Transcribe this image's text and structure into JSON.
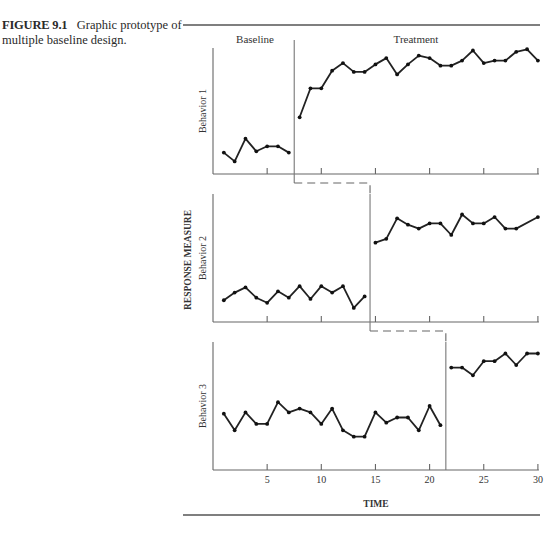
{
  "caption": {
    "figure_label": "FIGURE 9.1",
    "text": "Graphic prototype of multiple baseline design."
  },
  "chart_data": {
    "type": "line",
    "title": "Graphic prototype of multiple baseline design",
    "xlabel": "TIME",
    "ylabel": "RESPONSE MEASURE",
    "xlim": [
      0,
      30
    ],
    "ylim": [
      0,
      100
    ],
    "x_ticks": [
      5,
      10,
      15,
      20,
      25,
      30
    ],
    "x_tick_labels": [
      "5",
      "10",
      "15",
      "20",
      "25",
      "30"
    ],
    "grid": false,
    "legend": null,
    "phase_labels": [
      "Baseline",
      "Treatment"
    ],
    "panels": [
      {
        "name": "Behavior 1",
        "phase_change_after": 7,
        "series": [
          {
            "name": "Baseline",
            "x": [
              1,
              2,
              3,
              4,
              5,
              6,
              7
            ],
            "values": [
              17,
              10,
              28,
              18,
              22,
              22,
              17
            ]
          },
          {
            "name": "Treatment",
            "x": [
              8,
              9,
              10,
              11,
              12,
              13,
              14,
              15,
              16,
              17,
              18,
              19,
              20,
              21,
              22,
              23,
              24,
              25,
              26,
              27,
              28,
              29,
              30
            ],
            "values": [
              45,
              68,
              68,
              82,
              88,
              81,
              81,
              87,
              92,
              79,
              87,
              94,
              92,
              86,
              86,
              90,
              98,
              88,
              90,
              90,
              97,
              99,
              90
            ]
          }
        ]
      },
      {
        "name": "Behavior 2",
        "phase_change_after": 14,
        "series": [
          {
            "name": "Baseline",
            "x": [
              1,
              2,
              3,
              4,
              5,
              6,
              7,
              8,
              9,
              10,
              11,
              12,
              13,
              14
            ],
            "values": [
              17,
              23,
              27,
              19,
              15,
              24,
              19,
              28,
              18,
              28,
              23,
              28,
              11,
              20
            ]
          },
          {
            "name": "Treatment",
            "x": [
              15,
              16,
              17,
              18,
              19,
              20,
              21,
              22,
              23,
              24,
              25,
              26,
              27,
              28,
              30
            ],
            "values": [
              62,
              65,
              81,
              76,
              73,
              77,
              77,
              68,
              84,
              77,
              77,
              82,
              73,
              73,
              82
            ]
          }
        ]
      },
      {
        "name": "Behavior 3",
        "phase_change_after": 21,
        "series": [
          {
            "name": "Baseline",
            "x": [
              1,
              2,
              3,
              4,
              5,
              6,
              7,
              8,
              9,
              10,
              11,
              12,
              13,
              14,
              15,
              16,
              17,
              18,
              19,
              20,
              21
            ],
            "values": [
              44,
              31,
              45,
              36,
              36,
              53,
              45,
              48,
              45,
              36,
              48,
              31,
              26,
              26,
              45,
              37,
              41,
              41,
              31,
              50,
              35
            ]
          },
          {
            "name": "Treatment",
            "x": [
              22,
              23,
              24,
              25,
              26,
              27,
              28,
              29,
              30
            ],
            "values": [
              80,
              80,
              74,
              85,
              85,
              91,
              82,
              91,
              91
            ]
          }
        ]
      }
    ]
  }
}
